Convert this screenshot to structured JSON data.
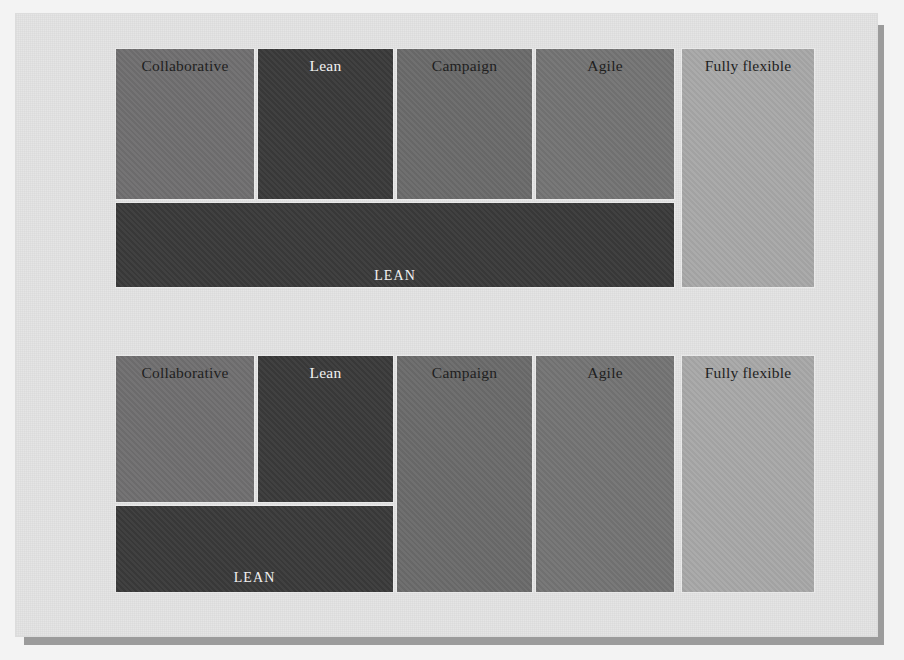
{
  "page": {
    "background_color": "#f3f3f3",
    "panel_color": "#e3e3e3",
    "shadow_color": "#9b9b9b",
    "gap_color": "#e9e9e9"
  },
  "palette": {
    "collaborative": "#706f70",
    "lean": "#3a3a3a",
    "campaign": "#6b6b6b",
    "agile": "#747474",
    "fully_flexible": "#a8a8a8",
    "label_dark": "#1f1f1f",
    "label_light": "#f2f2f2"
  },
  "diagrams": [
    {
      "id": "diagram-top",
      "name": "top-layout",
      "cells": [
        {
          "key": "collaborative",
          "label": "Collaborative",
          "color_key": "collaborative",
          "text_tone": "dark",
          "x": 115,
          "y": 48,
          "w": 140,
          "h": 152
        },
        {
          "key": "lean",
          "label": "Lean",
          "color_key": "lean",
          "text_tone": "light",
          "x": 257,
          "y": 48,
          "w": 137,
          "h": 152
        },
        {
          "key": "campaign",
          "label": "Campaign",
          "color_key": "campaign",
          "text_tone": "dark",
          "x": 396,
          "y": 48,
          "w": 137,
          "h": 152
        },
        {
          "key": "agile",
          "label": "Agile",
          "color_key": "agile",
          "text_tone": "dark",
          "x": 535,
          "y": 48,
          "w": 140,
          "h": 152
        },
        {
          "key": "fully-flexible",
          "label": "Fully flexible",
          "color_key": "fully_flexible",
          "text_tone": "dark",
          "x": 681,
          "y": 48,
          "w": 134,
          "h": 240
        },
        {
          "key": "lean-band",
          "label": "LEAN",
          "color_key": "lean",
          "text_tone": "light",
          "x": 115,
          "y": 202,
          "w": 560,
          "h": 86,
          "caps": true,
          "label_offset_y": 63
        }
      ]
    },
    {
      "id": "diagram-bottom",
      "name": "bottom-layout",
      "cells": [
        {
          "key": "collaborative",
          "label": "Collaborative",
          "color_key": "collaborative",
          "text_tone": "dark",
          "x": 115,
          "y": 355,
          "w": 140,
          "h": 148
        },
        {
          "key": "lean",
          "label": "Lean",
          "color_key": "lean",
          "text_tone": "light",
          "x": 257,
          "y": 355,
          "w": 137,
          "h": 148
        },
        {
          "key": "campaign",
          "label": "Campaign",
          "color_key": "campaign",
          "text_tone": "dark",
          "x": 396,
          "y": 355,
          "w": 137,
          "h": 238
        },
        {
          "key": "agile",
          "label": "Agile",
          "color_key": "agile",
          "text_tone": "dark",
          "x": 535,
          "y": 355,
          "w": 140,
          "h": 238
        },
        {
          "key": "fully-flexible",
          "label": "Fully flexible",
          "color_key": "fully_flexible",
          "text_tone": "dark",
          "x": 681,
          "y": 355,
          "w": 134,
          "h": 238
        },
        {
          "key": "lean-band",
          "label": "LEAN",
          "color_key": "lean",
          "text_tone": "light",
          "x": 115,
          "y": 505,
          "w": 279,
          "h": 88,
          "caps": true,
          "label_offset_y": 62
        }
      ]
    }
  ]
}
